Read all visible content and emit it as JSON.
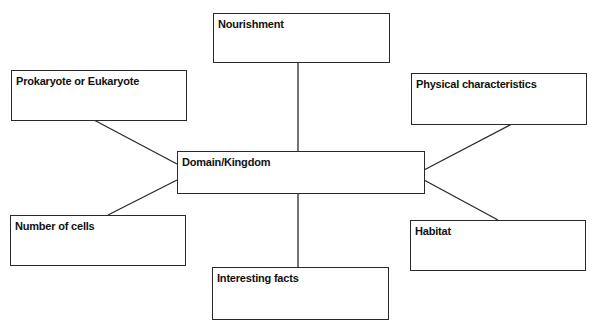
{
  "diagram": {
    "type": "concept-map",
    "center": {
      "id": "domain",
      "label": "Domain/Kingdom"
    },
    "nodes": [
      {
        "id": "nourishment",
        "label": "Nourishment"
      },
      {
        "id": "prokaryote",
        "label": "Prokaryote or Eukaryote"
      },
      {
        "id": "physical",
        "label": "Physical characteristics"
      },
      {
        "id": "cells",
        "label": "Number of cells"
      },
      {
        "id": "habitat",
        "label": "Habitat"
      },
      {
        "id": "facts",
        "label": "Interesting facts"
      }
    ],
    "edges": [
      {
        "from": "domain",
        "to": "nourishment"
      },
      {
        "from": "domain",
        "to": "prokaryote"
      },
      {
        "from": "domain",
        "to": "physical"
      },
      {
        "from": "domain",
        "to": "cells"
      },
      {
        "from": "domain",
        "to": "habitat"
      },
      {
        "from": "domain",
        "to": "facts"
      }
    ],
    "colors": {
      "line": "#2a2a2a",
      "text": "#111111",
      "background": "#ffffff"
    }
  }
}
